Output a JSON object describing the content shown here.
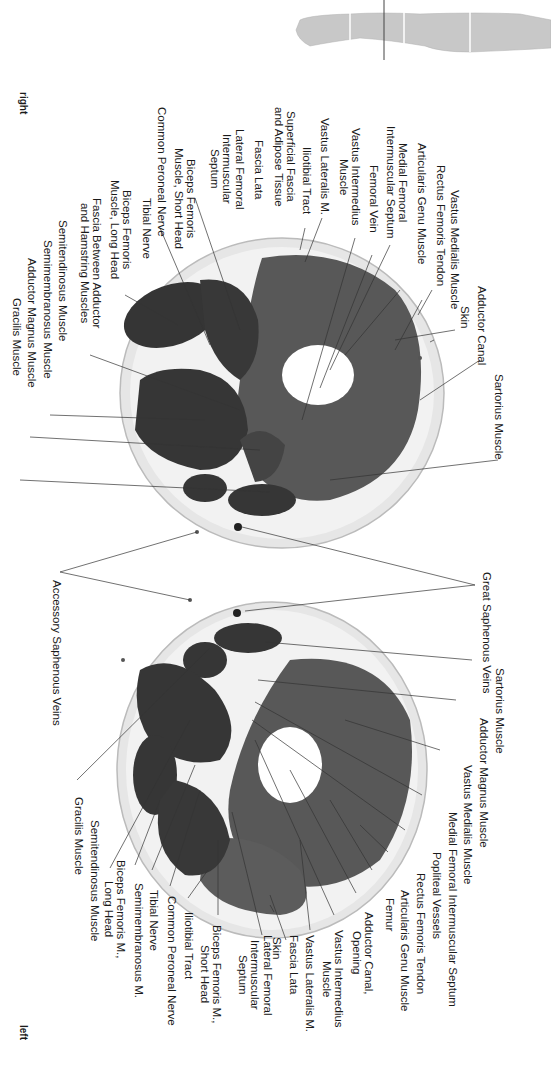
{
  "orientation": {
    "right": "right",
    "left": "left"
  },
  "body_silhouette": {
    "icon": "body-silhouette-icon",
    "section_marker": "section-line"
  },
  "upper_section": {
    "labels": [
      {
        "id": "vastus-medialis",
        "text": "Vastus Medialis Muscle"
      },
      {
        "id": "rectus-femoris-tendon",
        "text": "Rectus Femoris Tendon"
      },
      {
        "id": "articularis-genu",
        "text": "Articularis Genu Muscle"
      },
      {
        "id": "medial-femoral-septum",
        "text": "Medial Femoral\nIntermuscular Septum"
      },
      {
        "id": "femoral-vein",
        "text": "Femoral Vein"
      },
      {
        "id": "vastus-intermedius",
        "text": "Vastus Intermedius\nMuscle"
      },
      {
        "id": "vastus-lateralis",
        "text": "Vastus Lateralis M."
      },
      {
        "id": "iliotibial-tract",
        "text": "Iliotibial Tract"
      },
      {
        "id": "superficial-fascia",
        "text": "Superficial Fascia\nand Adipose Tissue"
      },
      {
        "id": "fascia-lata",
        "text": "Fascia Lata"
      },
      {
        "id": "lateral-femoral-septum",
        "text": "Lateral Femoral\nIntermuscular\nSeptum"
      },
      {
        "id": "biceps-short",
        "text": "Biceps Femoris\nMuscle, Short Head"
      },
      {
        "id": "common-peroneal",
        "text": "Common Peroneal Nerve"
      },
      {
        "id": "tibial-nerve",
        "text": "Tibial Nerve"
      },
      {
        "id": "biceps-long",
        "text": "Biceps Femoris\nMuscle, Long Head"
      },
      {
        "id": "fascia-between",
        "text": "Fascia Between Adductor\nand Hamstring Muscles"
      },
      {
        "id": "semitendinosus",
        "text": "Semitendinosus Muscle"
      },
      {
        "id": "semimembranosus",
        "text": "Semimembranosus Muscle"
      },
      {
        "id": "adductor-magnus",
        "text": "Adductor Magnus Muscle"
      },
      {
        "id": "gracilis",
        "text": "Gracilis Muscle"
      },
      {
        "id": "skin",
        "text": "Skin"
      },
      {
        "id": "adductor-canal",
        "text": "Adductor Canal"
      },
      {
        "id": "sartorius",
        "text": "Sartorius Muscle"
      }
    ]
  },
  "shared_labels": {
    "great_saphenous": "Great Saphenous Veins",
    "accessory_saphenous": "Accessory Saphenous Veins"
  },
  "lower_section": {
    "labels": [
      {
        "id": "sartorius",
        "text": "Sartorius Muscle"
      },
      {
        "id": "adductor-magnus",
        "text": "Adductor Magnus Muscle"
      },
      {
        "id": "vastus-medialis",
        "text": "Vastus Medialis Muscle"
      },
      {
        "id": "medial-femoral-septum",
        "text": "Medial Femoral Intermuscular Septum"
      },
      {
        "id": "popliteal-vessels",
        "text": "Popliteal Vessels"
      },
      {
        "id": "rectus-femoris-tendon",
        "text": "Rectus Femoris Tendon"
      },
      {
        "id": "articularis-genu",
        "text": "Articularis Genu Muscle"
      },
      {
        "id": "femur",
        "text": "Femur"
      },
      {
        "id": "adductor-canal-opening",
        "text": "Adductor Canal,\nOpening"
      },
      {
        "id": "vastus-intermedius",
        "text": "Vastus Intermedius\nMuscle"
      },
      {
        "id": "vastus-lateralis",
        "text": "Vastus Lateralis M."
      },
      {
        "id": "fascia-lata",
        "text": "Fascia Lata"
      },
      {
        "id": "skin",
        "text": "Skin"
      },
      {
        "id": "lateral-femoral-septum",
        "text": "Lateral Femoral\nIntermuscular\nSeptum"
      },
      {
        "id": "biceps-short",
        "text": "Biceps Femoris M.,\nShort Head"
      },
      {
        "id": "iliotibial-tract",
        "text": "Iliotibial Tract"
      },
      {
        "id": "common-peroneal",
        "text": "Common Peroneal Nerve"
      },
      {
        "id": "tibial-nerve",
        "text": "Tibial Nerve"
      },
      {
        "id": "semimembranosus",
        "text": "Semimembranosus M."
      },
      {
        "id": "biceps-long",
        "text": "Biceps Femoris M.,\nLong Head"
      },
      {
        "id": "semitendinosus",
        "text": "Semitendinosus Muscle"
      },
      {
        "id": "gracilis",
        "text": "Gracilis Muscle"
      }
    ]
  },
  "colors": {
    "muscle_dark": "#3a3a3a",
    "muscle_quad": "#5a5a5a",
    "fat": "#ededed",
    "skin_rim": "#d6d6d6",
    "bone": "#ffffff",
    "leader": "#333333"
  }
}
